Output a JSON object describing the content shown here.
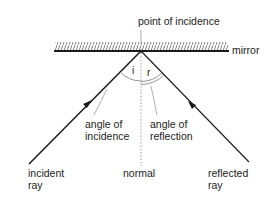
{
  "labels": {
    "point_of_incidence": "point of incidence",
    "mirror": "mirror",
    "angle_i": "i",
    "angle_r": "r",
    "angle_of_incidence_1": "angle of",
    "angle_of_incidence_2": "incidence",
    "angle_of_reflection_1": "angle of",
    "angle_of_reflection_2": "reflection",
    "incident_ray_1": "incident",
    "incident_ray_2": "ray",
    "normal": "normal",
    "reflected_ray_1": "reflected",
    "reflected_ray_2": "ray"
  },
  "colors": {
    "line": "#1a1a1a",
    "leader": "#9a9a9a",
    "hatch": "#666666"
  }
}
